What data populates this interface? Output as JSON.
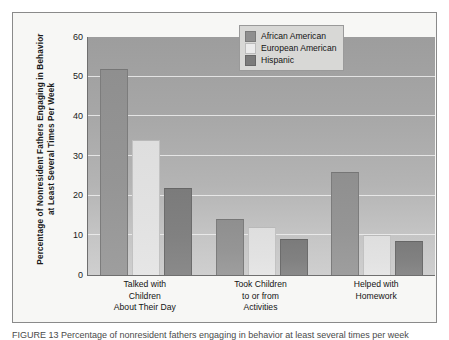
{
  "figure": {
    "caption_partial": "FIGURE 13  Percentage of nonresident fathers engaging in behavior at least several times per week"
  },
  "chart_data": {
    "type": "bar",
    "title": "",
    "xlabel": "",
    "ylabel": "Percentage of Nonresident Fathers Engaging in Behavior at Least Several Times Per Week",
    "ylim": [
      0,
      60
    ],
    "yticks": [
      0,
      10,
      20,
      30,
      40,
      50,
      60
    ],
    "ytick_labels": [
      "0",
      "10",
      "20",
      "30",
      "40",
      "50",
      "60"
    ],
    "grid": true,
    "legend_position": "top-right",
    "categories": [
      "Talked with Children About Their Day",
      "Took Children to or from Activities",
      "Helped with Homework"
    ],
    "category_lines": [
      [
        "Talked with",
        "Children",
        "About Their Day"
      ],
      [
        "Took Children",
        "to or from",
        "Activities"
      ],
      [
        "Helped with",
        "Homework"
      ]
    ],
    "series": [
      {
        "name": "African American",
        "values": [
          52,
          14,
          26
        ],
        "color": "#8f8f8f"
      },
      {
        "name": "European American",
        "values": [
          34,
          12,
          10
        ],
        "color": "#e3e3e3"
      },
      {
        "name": "Hispanic",
        "values": [
          22,
          9,
          8.5
        ],
        "color": "#7b7b7b"
      }
    ]
  }
}
